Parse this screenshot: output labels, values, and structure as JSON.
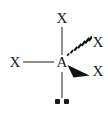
{
  "figure": {
    "background_color": "#fefefe",
    "line_color": "#8f8f8f",
    "text_color": "#1a1a1a"
  },
  "atoms": {
    "center": {
      "label": "A",
      "name": "central-atom"
    },
    "substituent_top": {
      "label": "X",
      "bond_type": "plain-line",
      "direction": "up"
    },
    "substituent_left": {
      "label": "X",
      "bond_type": "plain-line",
      "direction": "left"
    },
    "substituent_upper_right": {
      "label": "X",
      "bond_type": "hashed-wedge",
      "direction": "upper-right"
    },
    "substituent_lower_right": {
      "label": "X",
      "bond_type": "solid-wedge",
      "direction": "lower-right"
    }
  },
  "lone_pair": {
    "name": "lone-pair",
    "dot_count": 2,
    "bond_type": "plain-line",
    "direction": "down"
  },
  "hash_wedge": {
    "stripe_count": 7
  }
}
